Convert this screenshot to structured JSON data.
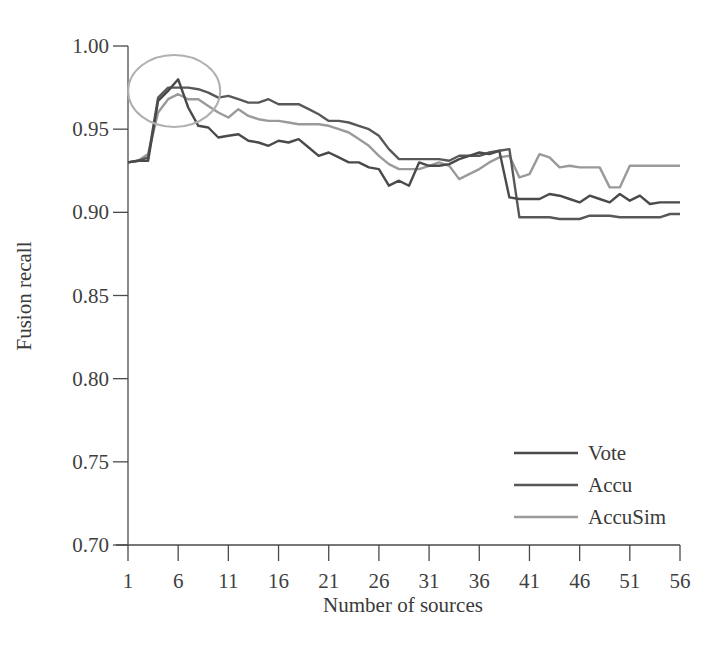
{
  "chart_data": {
    "type": "line",
    "title": "",
    "xlabel": "Number of sources",
    "ylabel": "Fusion recall",
    "xlim": [
      1,
      56
    ],
    "ylim": [
      0.7,
      1.0
    ],
    "x_ticks": [
      1,
      6,
      11,
      16,
      21,
      26,
      31,
      36,
      41,
      46,
      51,
      56
    ],
    "x_tick_labels": [
      "1",
      "6",
      "11",
      "16",
      "21",
      "26",
      "31",
      "36",
      "41",
      "46",
      "51",
      "56"
    ],
    "y_ticks": [
      0.7,
      0.75,
      0.8,
      0.85,
      0.9,
      0.95,
      1.0
    ],
    "y_tick_labels": [
      "0.70",
      "0.75",
      "0.80",
      "0.85",
      "0.90",
      "0.95",
      "1.00"
    ],
    "grid": false,
    "legend_position": "lower right",
    "annotations": [
      {
        "type": "ellipse",
        "description": "circle highlighting early peak around 6 sources",
        "cx": 6,
        "cy": 0.973,
        "color": "#b0b0b0"
      }
    ],
    "x": [
      1,
      2,
      3,
      4,
      5,
      6,
      7,
      8,
      9,
      10,
      11,
      12,
      13,
      14,
      15,
      16,
      17,
      18,
      19,
      20,
      21,
      22,
      23,
      24,
      25,
      26,
      27,
      28,
      29,
      30,
      31,
      32,
      33,
      34,
      35,
      36,
      37,
      38,
      39,
      40,
      41,
      42,
      43,
      44,
      45,
      46,
      47,
      48,
      49,
      50,
      51,
      52,
      53,
      54,
      55,
      56
    ],
    "series": [
      {
        "name": "Vote",
        "color": "#4a4a4a",
        "values": [
          0.93,
          0.931,
          0.931,
          0.967,
          0.973,
          0.98,
          0.963,
          0.952,
          0.951,
          0.945,
          0.946,
          0.947,
          0.943,
          0.942,
          0.94,
          0.943,
          0.942,
          0.944,
          0.939,
          0.934,
          0.936,
          0.933,
          0.93,
          0.93,
          0.927,
          0.926,
          0.916,
          0.919,
          0.916,
          0.93,
          0.928,
          0.928,
          0.929,
          0.932,
          0.934,
          0.936,
          0.935,
          0.937,
          0.909,
          0.908,
          0.908,
          0.908,
          0.911,
          0.91,
          0.908,
          0.906,
          0.91,
          0.908,
          0.906,
          0.911,
          0.907,
          0.91,
          0.905,
          0.906,
          0.906,
          0.906
        ]
      },
      {
        "name": "Accu",
        "color": "#585858",
        "values": [
          0.93,
          0.931,
          0.933,
          0.969,
          0.975,
          0.975,
          0.975,
          0.974,
          0.972,
          0.969,
          0.97,
          0.968,
          0.966,
          0.966,
          0.968,
          0.965,
          0.965,
          0.965,
          0.962,
          0.959,
          0.955,
          0.955,
          0.954,
          0.952,
          0.95,
          0.946,
          0.938,
          0.932,
          0.932,
          0.932,
          0.932,
          0.932,
          0.931,
          0.934,
          0.934,
          0.934,
          0.936,
          0.937,
          0.938,
          0.897,
          0.897,
          0.897,
          0.897,
          0.896,
          0.896,
          0.896,
          0.898,
          0.898,
          0.898,
          0.897,
          0.897,
          0.897,
          0.897,
          0.897,
          0.899,
          0.899
        ]
      },
      {
        "name": "AccuSim",
        "color": "#9a9a9a",
        "values": [
          0.93,
          0.931,
          0.935,
          0.96,
          0.968,
          0.971,
          0.968,
          0.968,
          0.964,
          0.96,
          0.957,
          0.962,
          0.958,
          0.956,
          0.955,
          0.955,
          0.954,
          0.953,
          0.953,
          0.953,
          0.952,
          0.95,
          0.948,
          0.944,
          0.94,
          0.934,
          0.929,
          0.926,
          0.926,
          0.926,
          0.928,
          0.93,
          0.928,
          0.92,
          0.923,
          0.926,
          0.93,
          0.933,
          0.934,
          0.921,
          0.923,
          0.935,
          0.933,
          0.927,
          0.928,
          0.927,
          0.927,
          0.927,
          0.915,
          0.915,
          0.928,
          0.928,
          0.928,
          0.928,
          0.928,
          0.928
        ]
      }
    ]
  },
  "legend": {
    "items": [
      {
        "label": "Vote",
        "color": "#4a4a4a"
      },
      {
        "label": "Accu",
        "color": "#585858"
      },
      {
        "label": "AccuSim",
        "color": "#9a9a9a"
      }
    ]
  },
  "axes": {
    "x_title": "Number of sources",
    "y_title": "Fusion recall"
  }
}
